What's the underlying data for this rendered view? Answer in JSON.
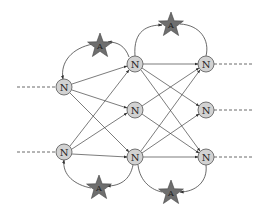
{
  "diagram": {
    "type": "neural-network-with-agents",
    "colors": {
      "node_fill": "#d2d2d2",
      "node_stroke": "#555555",
      "star_fill": "#6e6e6e",
      "star_stroke": "#444444",
      "edge": "#444444",
      "dashed": "#444444"
    },
    "nodes": [
      {
        "id": "in1",
        "label": "N",
        "x": 64,
        "y": 87
      },
      {
        "id": "in2",
        "label": "N",
        "x": 64,
        "y": 152
      },
      {
        "id": "h1",
        "label": "N",
        "x": 135,
        "y": 64
      },
      {
        "id": "h2",
        "label": "N",
        "x": 135,
        "y": 110
      },
      {
        "id": "h3",
        "label": "N",
        "x": 135,
        "y": 157
      },
      {
        "id": "o1",
        "label": "N",
        "x": 206,
        "y": 64
      },
      {
        "id": "o2",
        "label": "N",
        "x": 206,
        "y": 110
      },
      {
        "id": "o3",
        "label": "N",
        "x": 206,
        "y": 157
      }
    ],
    "agents": [
      {
        "id": "a1",
        "label": "A",
        "x": 100,
        "y": 45
      },
      {
        "id": "a2",
        "label": "A",
        "x": 171,
        "y": 24
      },
      {
        "id": "a3",
        "label": "A",
        "x": 99,
        "y": 187
      },
      {
        "id": "a4",
        "label": "A",
        "x": 171,
        "y": 192
      }
    ]
  }
}
